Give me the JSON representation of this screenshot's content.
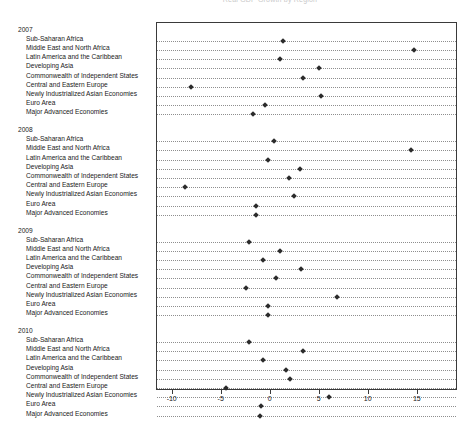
{
  "chart_data": {
    "type": "scatter",
    "title": "Real GDP Growth by Region",
    "xlabel": "",
    "ylabel": "",
    "xlim": [
      -11.5,
      19.0
    ],
    "xticks": [
      -10,
      -5,
      0,
      5,
      10,
      15
    ],
    "xticklabels": [
      "-10",
      "-5",
      "0",
      "5",
      "10",
      "15"
    ],
    "grid": true,
    "grid_style": "dotted-horizontal",
    "legend": "none",
    "marker": "diamond",
    "marker_color": "#2b2b2b",
    "categories": [
      "Sub-Saharan Africa",
      "Middle East and North Africa",
      "Latin America and the Caribbean",
      "Developing Asia",
      "Commonwealth of Independent States",
      "Central and Eastern Europe",
      "Newly Industrialized Asian Economies",
      "Euro Area",
      "Major Advanced Economies"
    ],
    "groups": [
      {
        "year": "2007",
        "values": [
          1.4,
          14.7,
          1.0,
          5.0,
          3.4,
          -8.0,
          5.2,
          -0.5,
          -1.7
        ]
      },
      {
        "year": "2008",
        "values": [
          0.4,
          14.4,
          -0.2,
          3.1,
          2.0,
          -8.6,
          2.5,
          -1.4,
          -1.4
        ]
      },
      {
        "year": "2009",
        "values": [
          -2.1,
          1.0,
          -0.7,
          3.2,
          0.6,
          -2.4,
          6.9,
          -0.2,
          -0.2
        ]
      },
      {
        "year": "2010",
        "values": [
          -2.1,
          3.4,
          -0.7,
          1.7,
          2.1,
          -4.5,
          6.0,
          -0.9,
          -1.0
        ]
      }
    ]
  }
}
